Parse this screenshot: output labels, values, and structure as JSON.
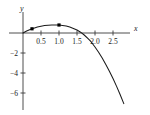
{
  "chart_data": {
    "type": "line",
    "title": "",
    "xlabel": "x",
    "ylabel": "y",
    "grid": false,
    "legend": false,
    "xlim": [
      -0.25,
      3.0
    ],
    "ylim": [
      -7.2,
      1.4
    ],
    "xticks": [
      0.5,
      1.0,
      1.5,
      2.0,
      2.5
    ],
    "xtick_labels": [
      "0.5",
      "1.0",
      "1.5",
      "2.0",
      "2.5"
    ],
    "yticks": [
      -2,
      -4,
      -6
    ],
    "ytick_labels": [
      "−2",
      "−4",
      "−6"
    ],
    "curve_color": "#1a1a1a",
    "axis_color": "#3a3a3a",
    "marker_color": "#000000",
    "series": [
      {
        "name": "curve",
        "x": [
          0.0,
          0.1,
          0.2,
          0.25,
          0.3,
          0.4,
          0.5,
          0.6,
          0.7,
          0.8,
          0.9,
          1.0,
          1.1,
          1.2,
          1.3,
          1.4,
          1.5,
          1.6,
          1.7,
          1.8,
          1.85,
          1.9,
          2.0,
          2.1,
          2.2,
          2.3,
          2.4,
          2.5,
          2.6,
          2.7,
          2.8,
          2.9
        ],
        "y": [
          0.0,
          0.2,
          0.36,
          0.42,
          0.48,
          0.6,
          0.68,
          0.74,
          0.78,
          0.8,
          0.81,
          0.8,
          0.76,
          0.7,
          0.6,
          0.46,
          0.3,
          0.08,
          -0.2,
          -0.54,
          -0.72,
          -0.92,
          -1.4,
          -1.92,
          -2.5,
          -3.14,
          -3.82,
          -4.56,
          -5.34,
          -6.18,
          -7.06,
          -8.0
        ]
      }
    ],
    "points": [
      {
        "label": "",
        "x": 0.25,
        "y": 0.42
      },
      {
        "label": "",
        "x": 1.0,
        "y": 0.8
      }
    ]
  }
}
